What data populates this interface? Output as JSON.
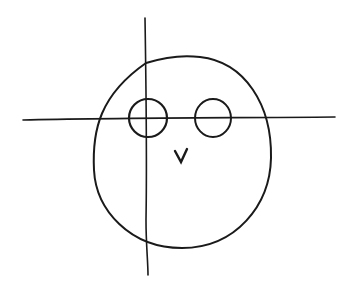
{
  "drawing": {
    "subject": "hand-drawn owl face sketch with construction guidelines",
    "stroke_color": "#1a1a1a",
    "background": "#ffffff",
    "guidelines": {
      "vertical": {
        "x1": 145,
        "y1": 18,
        "x2": 148,
        "y2": 275
      },
      "horizontal": {
        "x1": 23,
        "y1": 119,
        "x2": 335,
        "y2": 117
      }
    },
    "head": {
      "cx": 182,
      "cy": 152,
      "rx": 89,
      "ry": 96
    },
    "eyes": [
      {
        "cx": 148,
        "cy": 118,
        "r": 19
      },
      {
        "cx": 213,
        "cy": 118,
        "r": 18
      }
    ],
    "beak": {
      "glyph": "v",
      "x": 181,
      "y": 155
    }
  }
}
